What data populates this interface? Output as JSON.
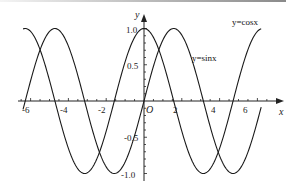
{
  "chart_data": {
    "type": "line",
    "title": "",
    "xlabel": "x",
    "ylabel": "y",
    "origin_label": "O",
    "xlim": [
      -6.5,
      7
    ],
    "ylim": [
      -1.0,
      1.0
    ],
    "grid": false,
    "legend": "inline labels on curves",
    "x_ticks": [
      -6,
      -4,
      -2,
      2,
      4,
      6
    ],
    "x_tick_labels": [
      "-6",
      "-4",
      "-2",
      "2",
      "4",
      "6"
    ],
    "y_ticks": [
      1.0,
      0.5,
      -0.5,
      -1.0
    ],
    "y_tick_labels": [
      "1.0",
      "0.5",
      "-0.5",
      "-1.0"
    ],
    "series": [
      {
        "name": "y=sinx",
        "function": "sin(x)",
        "domain": [
          -6.4,
          6.2
        ],
        "x": [
          -6.28,
          -4.71,
          -3.14,
          -1.57,
          0,
          1.57,
          3.14,
          4.71,
          6.28
        ],
        "values": [
          0,
          1,
          0,
          -1,
          0,
          1,
          0,
          -1,
          0
        ]
      },
      {
        "name": "y=cosx",
        "function": "cos(x)",
        "domain": [
          -6.4,
          6.2
        ],
        "x": [
          -6.28,
          -4.71,
          -3.14,
          -1.57,
          0,
          1.57,
          3.14,
          4.71,
          6.28
        ],
        "values": [
          1,
          0,
          -1,
          0,
          1,
          0,
          -1,
          0,
          1
        ]
      }
    ],
    "annotations": [
      {
        "text": "y=cosx",
        "near_x": 6.0,
        "near_y": 1.0
      },
      {
        "text": "y=sinx",
        "near_x": 3.0,
        "near_y": 0.55
      }
    ]
  },
  "labels": {
    "x_axis": "x",
    "y_axis": "y",
    "origin": "O",
    "sin_label": "y=sinx",
    "cos_label": "y=cosx",
    "xt": [
      "-6",
      "-4",
      "-2",
      "2",
      "4",
      "6"
    ],
    "yt": [
      "1.0",
      "0.5",
      "-0.5",
      "-1.0"
    ]
  }
}
